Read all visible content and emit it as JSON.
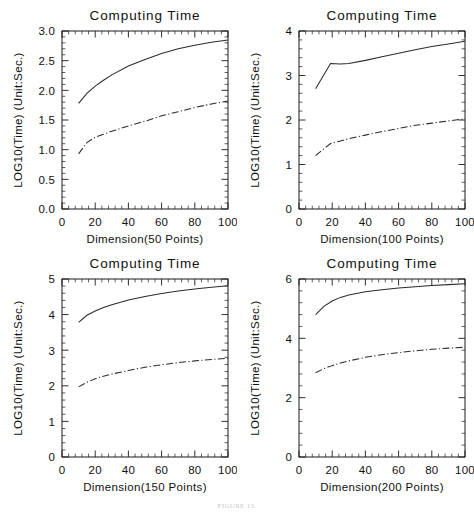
{
  "figure": {
    "caption": "FIGURE 13.",
    "panel_count": 4
  },
  "chart_data": [
    {
      "type": "line",
      "title": "Computing Time",
      "xlabel": "Dimension(50 Points)",
      "ylabel": "LOG10(Time) (Unit:Sec.)",
      "xlim": [
        0,
        100
      ],
      "ylim": [
        0.0,
        3.0
      ],
      "xticks": [
        0,
        20,
        40,
        60,
        80,
        100
      ],
      "xticklabels": [
        "0",
        "20",
        "40",
        "60",
        "80",
        "100"
      ],
      "yticks": [
        0.0,
        0.5,
        1.0,
        1.5,
        2.0,
        2.5,
        3.0
      ],
      "yticklabels": [
        "0.0",
        "0.5",
        "1.0",
        "1.5",
        "2.0",
        "2.5",
        "3.0"
      ],
      "grid": false,
      "legend": "none",
      "x": [
        10,
        15,
        20,
        25,
        30,
        40,
        50,
        60,
        70,
        80,
        90,
        100
      ],
      "series": [
        {
          "name": "solid",
          "style": "solid",
          "values": [
            1.78,
            1.95,
            2.07,
            2.17,
            2.26,
            2.41,
            2.52,
            2.62,
            2.7,
            2.76,
            2.81,
            2.85
          ]
        },
        {
          "name": "dash-dot",
          "style": "dash-dot",
          "values": [
            0.93,
            1.12,
            1.21,
            1.26,
            1.31,
            1.4,
            1.48,
            1.57,
            1.64,
            1.71,
            1.77,
            1.82
          ]
        }
      ]
    },
    {
      "type": "line",
      "title": "Computing Time",
      "xlabel": "Dimension(100 Points)",
      "ylabel": "LOG10(Time) (Unit:Sec.)",
      "xlim": [
        0,
        100
      ],
      "ylim": [
        0,
        4
      ],
      "xticks": [
        0,
        20,
        40,
        60,
        80,
        100
      ],
      "xticklabels": [
        "0",
        "20",
        "40",
        "60",
        "80",
        "100"
      ],
      "yticks": [
        0,
        1,
        2,
        3,
        4
      ],
      "yticklabels": [
        "0",
        "1",
        "2",
        "3",
        "4"
      ],
      "grid": false,
      "legend": "none",
      "x": [
        10,
        19,
        25,
        30,
        40,
        50,
        60,
        70,
        80,
        90,
        100
      ],
      "series": [
        {
          "name": "solid",
          "style": "solid",
          "values": [
            2.7,
            3.27,
            3.26,
            3.27,
            3.34,
            3.42,
            3.5,
            3.58,
            3.65,
            3.71,
            3.77
          ]
        },
        {
          "name": "dash-dot",
          "style": "dash-dot",
          "values": [
            1.2,
            1.47,
            1.53,
            1.58,
            1.66,
            1.74,
            1.81,
            1.88,
            1.93,
            1.98,
            2.03
          ]
        }
      ]
    },
    {
      "type": "line",
      "title": "Computing Time",
      "xlabel": "Dimension(150 Points)",
      "ylabel": "LOG10(Time) (Unit:Sec.)",
      "xlim": [
        0,
        100
      ],
      "ylim": [
        0,
        5
      ],
      "xticks": [
        0,
        20,
        40,
        60,
        80,
        100
      ],
      "xticklabels": [
        "0",
        "20",
        "40",
        "60",
        "80",
        "100"
      ],
      "yticks": [
        0,
        1,
        2,
        3,
        4,
        5
      ],
      "yticklabels": [
        "0",
        "1",
        "2",
        "3",
        "4",
        "5"
      ],
      "grid": false,
      "legend": "none",
      "x": [
        10,
        15,
        20,
        25,
        30,
        40,
        50,
        60,
        70,
        80,
        90,
        100
      ],
      "series": [
        {
          "name": "solid",
          "style": "solid",
          "values": [
            3.78,
            3.98,
            4.1,
            4.2,
            4.28,
            4.41,
            4.51,
            4.59,
            4.66,
            4.72,
            4.77,
            4.81
          ]
        },
        {
          "name": "dash-dot",
          "style": "dash-dot",
          "values": [
            1.97,
            2.1,
            2.2,
            2.27,
            2.33,
            2.43,
            2.52,
            2.59,
            2.65,
            2.7,
            2.74,
            2.77
          ]
        }
      ]
    },
    {
      "type": "line",
      "title": "Computing Time",
      "xlabel": "Dimension(200 Points)",
      "ylabel": "LOG10(Time) (Unit:Sec.)",
      "xlim": [
        0,
        100
      ],
      "ylim": [
        0,
        6
      ],
      "xticks": [
        0,
        20,
        40,
        60,
        80,
        100
      ],
      "xticklabels": [
        "0",
        "20",
        "40",
        "60",
        "80",
        "100"
      ],
      "yticks": [
        0,
        2,
        4,
        6
      ],
      "yticklabels": [
        "0",
        "2",
        "4",
        "6"
      ],
      "grid": false,
      "legend": "none",
      "x": [
        10,
        15,
        20,
        25,
        30,
        40,
        50,
        60,
        70,
        80,
        90,
        100
      ],
      "series": [
        {
          "name": "solid",
          "style": "solid",
          "values": [
            4.8,
            5.08,
            5.26,
            5.38,
            5.46,
            5.57,
            5.64,
            5.7,
            5.74,
            5.78,
            5.81,
            5.84
          ]
        },
        {
          "name": "dash-dot",
          "style": "dash-dot",
          "values": [
            2.84,
            2.98,
            3.08,
            3.17,
            3.24,
            3.36,
            3.45,
            3.52,
            3.58,
            3.63,
            3.67,
            3.7
          ]
        }
      ]
    }
  ]
}
